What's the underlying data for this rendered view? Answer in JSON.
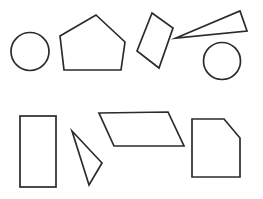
{
  "canvas": {
    "width": 263,
    "height": 199,
    "background_color": "#ffffff",
    "stroke_color": "#2b2b2b",
    "stroke_width": 1.7,
    "fill": "none",
    "title": "Geometric Shapes"
  },
  "chart_data": {
    "type": "diagram",
    "xlabel": "",
    "ylabel": "",
    "grid": false,
    "legend": "none",
    "xlim": [
      0,
      263
    ],
    "ylim": [
      0,
      199
    ],
    "shape_count": 8,
    "rows": [
      {
        "row": 1,
        "shape_names": [
          "circle-small",
          "pentagon",
          "rotated-rectangle",
          "thin-triangle",
          "circle-right"
        ]
      },
      {
        "row": 2,
        "shape_names": [
          "tall-rectangle",
          "arrow-triangle",
          "parallelogram",
          "cut-corner-square"
        ]
      }
    ],
    "shapes": [
      {
        "name": "circle-small",
        "kind": "circle",
        "row": 1,
        "cx": 30,
        "cy": 51.5,
        "r": 19,
        "stroke": "#2b2b2b",
        "fill": "none"
      },
      {
        "name": "pentagon",
        "kind": "polygon",
        "row": 1,
        "sides": 5,
        "points": "96,15 125,42 121,70 64,70 60,36",
        "stroke": "#2b2b2b",
        "fill": "none"
      },
      {
        "name": "rotated-rectangle",
        "kind": "polygon",
        "row": 1,
        "sides": 4,
        "points": "152,13 173,28 159,68 137,51",
        "stroke": "#2b2b2b",
        "fill": "none"
      },
      {
        "name": "thin-triangle",
        "kind": "polygon",
        "row": 1,
        "sides": 3,
        "points": "176,38 240,11 247,31",
        "stroke": "#2b2b2b",
        "fill": "none"
      },
      {
        "name": "circle-right",
        "kind": "circle",
        "row": 1,
        "cx": 222,
        "cy": 61,
        "r": 18.5,
        "stroke": "#2b2b2b",
        "fill": "none"
      },
      {
        "name": "tall-rectangle",
        "kind": "rect",
        "row": 2,
        "x": 20,
        "y": 116,
        "width": 36,
        "height": 71,
        "stroke": "#2b2b2b",
        "fill": "none"
      },
      {
        "name": "arrow-triangle",
        "kind": "polygon",
        "row": 2,
        "sides": 3,
        "points": "72,131 102,163 89,185",
        "stroke": "#2b2b2b",
        "fill": "none"
      },
      {
        "name": "parallelogram",
        "kind": "polygon",
        "row": 2,
        "sides": 4,
        "points": "99,113 168,112 184,146 114,146",
        "stroke": "#2b2b2b",
        "fill": "none"
      },
      {
        "name": "cut-corner-square",
        "kind": "polygon",
        "row": 2,
        "sides": 5,
        "points": "192,119 224,119 240,138 240,177 192,177",
        "stroke": "#2b2b2b",
        "fill": "none"
      }
    ]
  }
}
